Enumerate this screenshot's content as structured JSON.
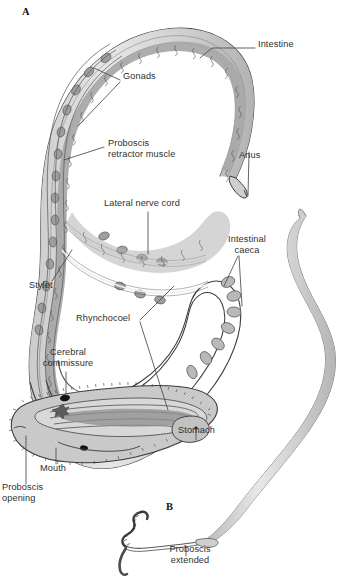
{
  "figure": {
    "panels": [
      {
        "id": "A",
        "letter": "A",
        "caption": "Internal anatomy of a nemertean (ribbon worm), proboscis retracted"
      },
      {
        "id": "B",
        "letter": "B",
        "caption": "Proboscis extended"
      }
    ],
    "colors": {
      "body_wall": "#d9d9d9",
      "body_wall_dark": "#b4b4b4",
      "interior": "#a9a9a9",
      "interior_light": "#c6c6c6",
      "outline": "#3b3b3b",
      "label_text": "#2f2f2f",
      "leader_line": "#4a4a4a",
      "background": "#ffffff",
      "dark_spot": "#1a1a1a"
    },
    "labels": [
      {
        "id": "intestine",
        "text": "Intestine",
        "x": 258,
        "y": 44,
        "align": "left"
      },
      {
        "id": "gonads",
        "text": "Gonads",
        "x": 123,
        "y": 76,
        "align": "left"
      },
      {
        "id": "proboscis-retractor",
        "text": "Proboscis\nretractor muscle",
        "x": 108,
        "y": 143,
        "align": "left"
      },
      {
        "id": "anus",
        "text": "Anus",
        "x": 239,
        "y": 155,
        "align": "left"
      },
      {
        "id": "lateral-nerve-cord",
        "text": "Lateral nerve cord",
        "x": 104,
        "y": 203,
        "align": "left"
      },
      {
        "id": "intestinal-caeca",
        "text": "Intestinal\ncaeca",
        "x": 219,
        "y": 239,
        "align": "left"
      },
      {
        "id": "stylet",
        "text": "Stylet",
        "x": 29,
        "y": 285,
        "align": "left"
      },
      {
        "id": "rhynchocoel",
        "text": "Rhynchocoel",
        "x": 76,
        "y": 318,
        "align": "left"
      },
      {
        "id": "cerebral-commissure",
        "text": "Cerebral\ncommissure",
        "x": 43,
        "y": 352,
        "align": "left"
      },
      {
        "id": "stomach",
        "text": "Stomach",
        "x": 178,
        "y": 430,
        "align": "left"
      },
      {
        "id": "mouth",
        "text": "Mouth",
        "x": 40,
        "y": 468,
        "align": "left"
      },
      {
        "id": "proboscis-opening",
        "text": "Proboscis\nopening",
        "x": 2,
        "y": 487,
        "align": "left"
      },
      {
        "id": "proboscis-extended",
        "text": "Proboscis\nextended",
        "x": 165,
        "y": 549,
        "align": "left"
      }
    ],
    "panel_letters": [
      {
        "id": "panel-a-letter",
        "text": "A",
        "x": 22,
        "y": 10
      },
      {
        "id": "panel-b-letter",
        "text": "B",
        "x": 166,
        "y": 505
      }
    ],
    "structures": [
      "body wall",
      "intestine",
      "intestinal caeca",
      "gonads",
      "proboscis retractor muscle",
      "rhynchocoel",
      "proboscis",
      "stylet",
      "lateral nerve cord",
      "cerebral commissure",
      "stomach",
      "mouth",
      "proboscis opening",
      "anus",
      "whole body outline"
    ]
  }
}
